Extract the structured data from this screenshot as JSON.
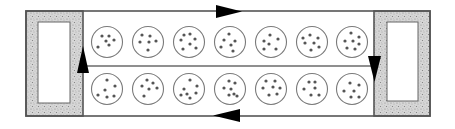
{
  "diagram": {
    "colors": {
      "outline": "#555555",
      "stipple_fill": "#c8c8c8",
      "dish_stroke": "#7a7a7a",
      "dot_fill": "#555555",
      "arrow_fill": "#000000"
    },
    "frame": {
      "x": 26,
      "y": 11,
      "width": 404,
      "height": 105
    },
    "end_blocks": [
      {
        "name": "left-end-block",
        "x": 26,
        "y": 11,
        "width": 57,
        "height": 105,
        "window": {
          "x": 38,
          "y": 22,
          "width": 32,
          "height": 81
        }
      },
      {
        "name": "right-end-block",
        "x": 374,
        "y": 11,
        "width": 56,
        "height": 105,
        "window": {
          "x": 387,
          "y": 22,
          "width": 31,
          "height": 79
        }
      }
    ],
    "divider_y": 66,
    "arrows": [
      {
        "name": "top-arrow",
        "direction": "right",
        "points": "216,5 216,18 242,11.5"
      },
      {
        "name": "right-arrow",
        "direction": "down",
        "points": "368,56 381,56 374.5,82"
      },
      {
        "name": "bottom-arrow",
        "direction": "left",
        "points": "240,109 240,122 213,115.5"
      },
      {
        "name": "left-arrow",
        "direction": "up",
        "points": "77,73 89,73 83,46"
      }
    ],
    "rows": [
      {
        "name": "top-row",
        "cy": 42,
        "dishes": [
          {
            "cx": 107,
            "dots": [
              [
                -5,
                -6
              ],
              [
                2,
                -6
              ],
              [
                -1,
                -1
              ],
              [
                7,
                -2
              ],
              [
                -9,
                5
              ],
              [
                2,
                3
              ]
            ]
          },
          {
            "cx": 148,
            "dots": [
              [
                -6,
                -7
              ],
              [
                2,
                -6
              ],
              [
                -8,
                0
              ],
              [
                1,
                0
              ],
              [
                8,
                -1
              ],
              [
                0,
                8
              ]
            ]
          },
          {
            "cx": 189,
            "dots": [
              [
                -5,
                -7
              ],
              [
                1,
                -8
              ],
              [
                -8,
                -2
              ],
              [
                6,
                -3
              ],
              [
                1,
                2
              ],
              [
                -6,
                7
              ],
              [
                7,
                6
              ]
            ]
          },
          {
            "cx": 230,
            "dots": [
              [
                -1,
                -8
              ],
              [
                -6,
                -2
              ],
              [
                5,
                -1
              ],
              [
                -9,
                5
              ],
              [
                1,
                3
              ],
              [
                3,
                9
              ]
            ]
          },
          {
            "cx": 271,
            "dots": [
              [
                -1,
                -7
              ],
              [
                -7,
                -1
              ],
              [
                7,
                -3
              ],
              [
                -2,
                2
              ],
              [
                -7,
                7
              ],
              [
                5,
                7
              ]
            ]
          },
          {
            "cx": 312,
            "dots": [
              [
                -2,
                -7
              ],
              [
                6,
                -4
              ],
              [
                -7,
                1
              ],
              [
                2,
                1
              ],
              [
                -9,
                -4
              ],
              [
                7,
                5
              ],
              [
                -1,
                8
              ]
            ]
          },
          {
            "cx": 352,
            "dots": [
              [
                -1,
                -9
              ],
              [
                7,
                -5
              ],
              [
                -7,
                -1
              ],
              [
                1,
                -1
              ],
              [
                7,
                2
              ],
              [
                -5,
                6
              ],
              [
                3,
                7
              ]
            ]
          }
        ]
      },
      {
        "name": "bottom-row",
        "cy": 89,
        "dishes": [
          {
            "cx": 107,
            "dots": [
              [
                0,
                -9
              ],
              [
                8,
                -3
              ],
              [
                -2,
                1
              ],
              [
                -9,
                6
              ],
              [
                0,
                8
              ],
              [
                7,
                7
              ]
            ]
          },
          {
            "cx": 148,
            "dots": [
              [
                -1,
                -9
              ],
              [
                5,
                -6
              ],
              [
                -6,
                -3
              ],
              [
                9,
                -1
              ],
              [
                1,
                0
              ],
              [
                -4,
                7
              ]
            ]
          },
          {
            "cx": 189,
            "dots": [
              [
                1,
                -9
              ],
              [
                8,
                -3
              ],
              [
                -5,
                0
              ],
              [
                -2,
                5
              ],
              [
                7,
                4
              ],
              [
                -8,
                6
              ],
              [
                1,
                9
              ]
            ]
          },
          {
            "cx": 230,
            "dots": [
              [
                -1,
                -8
              ],
              [
                5,
                -6
              ],
              [
                -6,
                -1
              ],
              [
                1,
                0
              ],
              [
                4,
                5
              ],
              [
                -1,
                6
              ],
              [
                7,
                7
              ]
            ]
          },
          {
            "cx": 271,
            "dots": [
              [
                -5,
                -8
              ],
              [
                4,
                -8
              ],
              [
                -8,
                -1
              ],
              [
                2,
                -2
              ],
              [
                9,
                -1
              ],
              [
                -2,
                6
              ],
              [
                6,
                5
              ]
            ]
          },
          {
            "cx": 312,
            "dots": [
              [
                -3,
                -7
              ],
              [
                3,
                -7
              ],
              [
                -8,
                0
              ],
              [
                3,
                -1
              ],
              [
                -1,
                6
              ],
              [
                7,
                6
              ]
            ]
          },
          {
            "cx": 352,
            "dots": [
              [
                -2,
                -6
              ],
              [
                7,
                -4
              ],
              [
                -8,
                2
              ],
              [
                2,
                2
              ],
              [
                -1,
                8
              ],
              [
                7,
                8
              ]
            ]
          }
        ]
      }
    ],
    "dish_radius": 15.5,
    "dot_radius": 1.6
  }
}
